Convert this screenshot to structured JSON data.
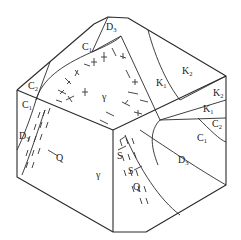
{
  "diagram": {
    "type": "geological-block-diagram",
    "colors": {
      "line": "#2a2a2a",
      "background": "#ffffff"
    },
    "top_face": {
      "labels": [
        {
          "id": "c2-top-left",
          "base": "C",
          "sub": "2"
        },
        {
          "id": "c1-top",
          "base": "C",
          "sub": "1"
        },
        {
          "id": "d3-top",
          "base": "D",
          "sub": "3"
        },
        {
          "id": "gamma-top",
          "base": "γ",
          "sub": ""
        },
        {
          "id": "k1-top",
          "base": "K",
          "sub": "1"
        },
        {
          "id": "k2-top",
          "base": "K",
          "sub": "2"
        }
      ]
    },
    "left_face": {
      "labels": [
        {
          "id": "c1-left",
          "base": "C",
          "sub": "1"
        },
        {
          "id": "d3-left",
          "base": "D",
          "sub": "3"
        },
        {
          "id": "q-left",
          "base": "Q",
          "sub": ""
        },
        {
          "id": "gamma-left",
          "base": "γ",
          "sub": ""
        }
      ]
    },
    "right_face": {
      "labels": [
        {
          "id": "k2-right",
          "base": "K",
          "sub": "2"
        },
        {
          "id": "k1-right",
          "base": "K",
          "sub": "1"
        },
        {
          "id": "c2-right",
          "base": "C",
          "sub": "2"
        },
        {
          "id": "c1-right",
          "base": "C",
          "sub": "1"
        },
        {
          "id": "d3-right",
          "base": "D",
          "sub": "3"
        },
        {
          "id": "s-right-1",
          "base": "S",
          "sub": ""
        },
        {
          "id": "s-right-2",
          "base": "S",
          "sub": ""
        },
        {
          "id": "q-right",
          "base": "Q",
          "sub": ""
        }
      ]
    }
  }
}
